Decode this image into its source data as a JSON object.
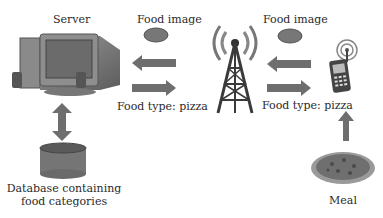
{
  "diagram": {
    "nodes": {
      "server": {
        "label": "Server",
        "icon": "desktop-computer-icon"
      },
      "database": {
        "label_line1": "Database containing",
        "label_line2": "food categories",
        "icon": "database-cylinder-icon"
      },
      "tower": {
        "icon": "radio-tower-icon"
      },
      "phone": {
        "icon": "mobile-phone-icon"
      },
      "meal": {
        "label": "Meal",
        "icon": "pizza-plate-icon"
      }
    },
    "edges": {
      "tower_to_server": {
        "top_label": "Food image",
        "top_icon": "pizza-thumbnail-icon",
        "direction": "left"
      },
      "server_to_tower": {
        "bottom_label": "Food type: pizza",
        "direction": "right"
      },
      "phone_to_tower": {
        "top_label": "Food image",
        "top_icon": "pizza-thumbnail-icon",
        "direction": "left"
      },
      "tower_to_phone": {
        "bottom_label": "Food type: pizza",
        "direction": "right"
      },
      "server_database": {
        "direction": "bidirectional-vertical"
      },
      "meal_to_phone": {
        "direction": "up"
      }
    },
    "colors": {
      "arrow": "#6e6e6e",
      "tower": "#3a3a3a",
      "signal": "#777777",
      "db": "#6f6f6f"
    }
  }
}
